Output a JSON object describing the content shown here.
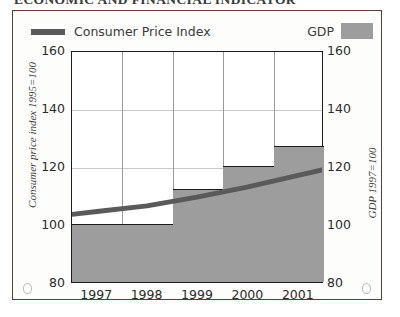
{
  "page": {
    "title": "ECONOMIC AND FINANCIAL INDICATOR"
  },
  "figure": {
    "legend": {
      "cpi_label": "Consumer Price Index",
      "gdp_label": "GDP",
      "cpi_color": "#5a5a5a",
      "gdp_color": "#9d9d9d"
    },
    "frame_color": "#5d4038"
  },
  "chart_data": {
    "type": "bar",
    "title": "",
    "categories": [
      "1997",
      "1998",
      "1999",
      "2000",
      "2001"
    ],
    "xlabel": "",
    "ylabel": "Consumer price index 1995=100",
    "y2label": "GDP 1997=100",
    "ylim": [
      80,
      160
    ],
    "y2lim": [
      80,
      160
    ],
    "yticks": [
      "160",
      "140",
      "120",
      "100",
      "80"
    ],
    "y2ticks": [
      "160",
      "140",
      "120",
      "100",
      "80"
    ],
    "grid": true,
    "legend_position": "top",
    "series": [
      {
        "name": "GDP",
        "type": "bar",
        "axis": "right",
        "color": "#9d9d9d",
        "values": [
          100,
          100,
          112,
          120,
          127
        ]
      },
      {
        "name": "Consumer Price Index",
        "type": "line",
        "axis": "left",
        "color": "#5a5a5a",
        "values": [
          104.5,
          106.5,
          109.5,
          113,
          117
        ]
      }
    ]
  }
}
